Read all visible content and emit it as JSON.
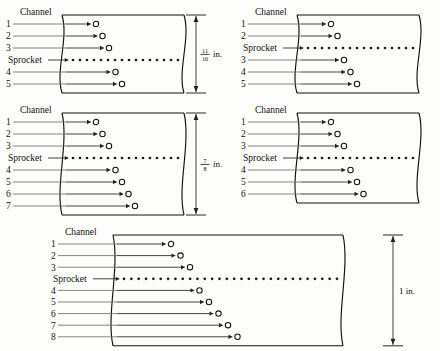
{
  "figure": {
    "unit_label": "in.",
    "channel_label": "Channel",
    "sprocket_label": "Sprocket"
  },
  "tapes": [
    {
      "id": "tape-5-channel-11-16",
      "channel_count": 5,
      "channel_numbers": [
        "1",
        "2",
        "3",
        "4",
        "5"
      ],
      "sprocket_after_channel": 3,
      "width_label": "11/16 in.",
      "width_numerator": "11",
      "width_denominator": "16",
      "width_unit": "in.",
      "has_dimension": true,
      "sprocket_dot_count": 16
    },
    {
      "id": "tape-5-channel-no-dim",
      "channel_count": 5,
      "channel_numbers": [
        "1",
        "2",
        "3",
        "4",
        "5"
      ],
      "sprocket_after_channel": 2,
      "width_label": "",
      "width_numerator": "",
      "width_denominator": "",
      "width_unit": "",
      "has_dimension": false,
      "sprocket_dot_count": 16
    },
    {
      "id": "tape-7-channel-7-8",
      "channel_count": 7,
      "channel_numbers": [
        "1",
        "2",
        "3",
        "4",
        "5",
        "6",
        "7"
      ],
      "sprocket_after_channel": 3,
      "width_label": "7/8 in.",
      "width_numerator": "7",
      "width_denominator": "8",
      "width_unit": "in.",
      "has_dimension": true,
      "sprocket_dot_count": 16
    },
    {
      "id": "tape-6-channel-no-dim",
      "channel_count": 6,
      "channel_numbers": [
        "1",
        "2",
        "3",
        "4",
        "5",
        "6"
      ],
      "sprocket_after_channel": 3,
      "width_label": "",
      "width_numerator": "",
      "width_denominator": "",
      "width_unit": "",
      "has_dimension": false,
      "sprocket_dot_count": 16
    },
    {
      "id": "tape-8-channel-1in",
      "channel_count": 8,
      "channel_numbers": [
        "1",
        "2",
        "3",
        "4",
        "5",
        "6",
        "7",
        "8"
      ],
      "sprocket_after_channel": 3,
      "width_label": "1 in.",
      "width_whole": "1",
      "width_unit": "in.",
      "has_dimension": true,
      "sprocket_dot_count": 30
    }
  ],
  "colors": {
    "ink": "#111111",
    "leader": "#6f6f6f",
    "paper": "#fdfdfb"
  }
}
